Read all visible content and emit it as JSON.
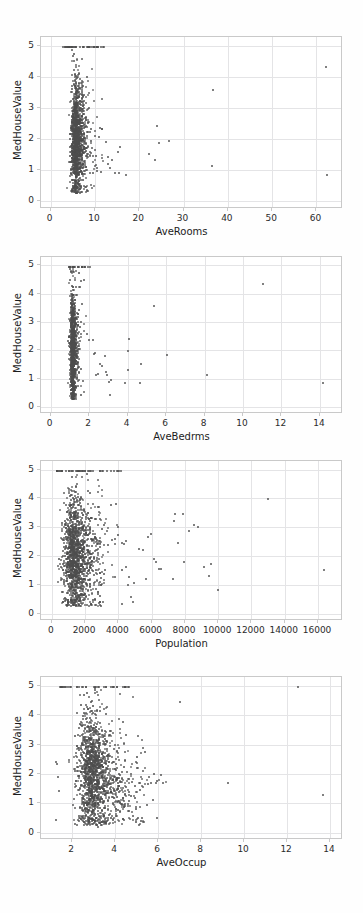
{
  "page": {
    "background_color": "#fefefe",
    "point_color": "#4d4d4d",
    "grid_color": "#e4e4e6",
    "spine_color": "#c9c9c9",
    "axis_text_color": "#2b2b2b"
  },
  "chart_data": [
    {
      "type": "scatter",
      "title": "",
      "xlabel": "AveRooms",
      "ylabel": "MedHouseValue",
      "xlim": [
        -2.2,
        66.0
      ],
      "ylim": [
        -0.25,
        5.3
      ],
      "xticks": [
        0,
        10,
        20,
        30,
        40,
        50,
        60
      ],
      "yticks": [
        0,
        1,
        2,
        3,
        4,
        5
      ],
      "grid": true,
      "legend": "none",
      "cluster": {
        "x_mode": 5.4,
        "x_spread": 1.5,
        "x_min": 1.2,
        "x_max": 12.0,
        "y_mode": 1.9,
        "y_spread": 0.85,
        "y_min": 0.3,
        "y_max": 5.0,
        "n": 1450
      },
      "capped_row": {
        "y": 5.0,
        "x_start": 2.6,
        "x_end": 11.8,
        "n": 46
      },
      "outliers": [
        [
          14.3,
          0.94
        ],
        [
          16.7,
          0.89
        ],
        [
          15.1,
          0.95
        ],
        [
          14.9,
          1.62
        ],
        [
          15.4,
          1.78
        ],
        [
          13.6,
          1.35
        ],
        [
          12.8,
          1.25
        ],
        [
          13.1,
          1.12
        ],
        [
          21.9,
          1.56
        ],
        [
          23.2,
          1.37
        ],
        [
          23.8,
          2.45
        ],
        [
          24.1,
          1.91
        ],
        [
          26.4,
          1.99
        ],
        [
          36.3,
          3.62
        ],
        [
          36.1,
          1.16
        ],
        [
          62.0,
          4.38
        ],
        [
          62.2,
          0.89
        ],
        [
          11.4,
          2.38
        ],
        [
          10.8,
          2.39
        ],
        [
          12.2,
          1.95
        ],
        [
          10.2,
          1.02
        ],
        [
          11.1,
          0.98
        ],
        [
          12.6,
          1.45
        ],
        [
          10.6,
          2.1
        ]
      ]
    },
    {
      "type": "scatter",
      "title": "",
      "xlabel": "AveBedrms",
      "ylabel": "MedHouseValue",
      "xlim": [
        -0.5,
        15.2
      ],
      "ylim": [
        -0.25,
        5.3
      ],
      "xticks": [
        0,
        2,
        4,
        6,
        8,
        10,
        12,
        14
      ],
      "yticks": [
        0,
        1,
        2,
        3,
        4,
        5
      ],
      "grid": true,
      "legend": "none",
      "cluster": {
        "x_mode": 1.08,
        "x_spread": 0.16,
        "x_min": 0.6,
        "x_max": 2.1,
        "y_mode": 1.9,
        "y_spread": 0.9,
        "y_min": 0.3,
        "y_max": 5.0,
        "n": 1100
      },
      "capped_row": {
        "y": 5.0,
        "x_start": 0.9,
        "x_end": 2.0,
        "n": 26
      },
      "outliers": [
        [
          2.2,
          1.9
        ],
        [
          2.25,
          1.96
        ],
        [
          2.3,
          1.18
        ],
        [
          2.4,
          1.2
        ],
        [
          2.5,
          1.55
        ],
        [
          2.6,
          1.5
        ],
        [
          2.75,
          1.82
        ],
        [
          2.85,
          1.28
        ],
        [
          2.9,
          1.18
        ],
        [
          3.0,
          0.93
        ],
        [
          3.05,
          0.45
        ],
        [
          3.1,
          1.0
        ],
        [
          3.8,
          0.89
        ],
        [
          3.95,
          1.36
        ],
        [
          3.98,
          2.0
        ],
        [
          4.0,
          2.45
        ],
        [
          4.6,
          0.9
        ],
        [
          4.65,
          1.55
        ],
        [
          5.3,
          3.62
        ],
        [
          6.0,
          1.88
        ],
        [
          8.05,
          1.16
        ],
        [
          11.0,
          4.38
        ],
        [
          14.1,
          0.89
        ],
        [
          2.15,
          2.4
        ],
        [
          1.95,
          2.4
        ],
        [
          1.85,
          2.6
        ],
        [
          1.6,
          3.68
        ],
        [
          1.55,
          4.5
        ],
        [
          1.7,
          4.52
        ],
        [
          1.45,
          4.28
        ],
        [
          1.3,
          3.15
        ]
      ]
    },
    {
      "type": "scatter",
      "title": "",
      "xlabel": "Population",
      "ylabel": "MedHouseValue",
      "xlim": [
        -650,
        17500
      ],
      "ylim": [
        -0.25,
        5.3
      ],
      "xticks": [
        0,
        2000,
        4000,
        6000,
        8000,
        10000,
        12000,
        14000,
        16000
      ],
      "yticks": [
        0,
        1,
        2,
        3,
        4,
        5
      ],
      "grid": true,
      "legend": "none",
      "cluster": {
        "x_mode": 1200,
        "x_spread": 780,
        "x_min": 80,
        "x_max": 4200,
        "y_mode": 1.85,
        "y_spread": 0.95,
        "y_min": 0.3,
        "y_max": 5.0,
        "n": 1500
      },
      "capped_row": {
        "y": 5.0,
        "x_start": 220,
        "x_end": 4100,
        "n": 48
      },
      "outliers": [
        [
          4600,
          1.33
        ],
        [
          4700,
          0.62
        ],
        [
          4800,
          0.45
        ],
        [
          4900,
          1.1
        ],
        [
          5200,
          2.3
        ],
        [
          5400,
          2.25
        ],
        [
          5600,
          1.25
        ],
        [
          5700,
          2.7
        ],
        [
          5900,
          2.8
        ],
        [
          6050,
          1.95
        ],
        [
          6200,
          1.85
        ],
        [
          6400,
          1.6
        ],
        [
          6500,
          1.58
        ],
        [
          7200,
          1.25
        ],
        [
          7300,
          3.25
        ],
        [
          7350,
          3.5
        ],
        [
          7500,
          2.5
        ],
        [
          7800,
          3.5
        ],
        [
          7900,
          1.85
        ],
        [
          8200,
          2.9
        ],
        [
          8500,
          3.1
        ],
        [
          8700,
          3.05
        ],
        [
          9100,
          1.65
        ],
        [
          9400,
          1.35
        ],
        [
          9500,
          1.78
        ],
        [
          9900,
          0.85
        ],
        [
          12900,
          4.02
        ],
        [
          16300,
          1.55
        ],
        [
          4300,
          2.45
        ],
        [
          4400,
          1.65
        ],
        [
          4500,
          1.05
        ],
        [
          3900,
          3.05
        ]
      ]
    },
    {
      "type": "scatter",
      "title": "",
      "xlabel": "AveOccup",
      "ylabel": "MedHouseValue",
      "xlim": [
        0.55,
        14.6
      ],
      "ylim": [
        -0.25,
        5.3
      ],
      "xticks": [
        2,
        4,
        6,
        8,
        10,
        12,
        14
      ],
      "yticks": [
        0,
        1,
        2,
        3,
        4,
        5
      ],
      "grid": true,
      "legend": "none",
      "cluster": {
        "x_mode": 2.8,
        "x_spread": 0.85,
        "x_min": 1.15,
        "x_max": 5.4,
        "y_mode": 1.85,
        "y_spread": 0.95,
        "y_min": 0.3,
        "y_max": 5.0,
        "n": 1550
      },
      "capped_row": {
        "y": 5.0,
        "x_start": 1.4,
        "x_end": 4.6,
        "n": 42
      },
      "outliers": [
        [
          5.5,
          1.68
        ],
        [
          5.6,
          1.72
        ],
        [
          5.7,
          1.15
        ],
        [
          5.75,
          2.05
        ],
        [
          5.85,
          1.72
        ],
        [
          6.1,
          2.0
        ],
        [
          6.2,
          1.72
        ],
        [
          4.3,
          3.8
        ],
        [
          4.45,
          3.35
        ],
        [
          6.95,
          4.5
        ],
        [
          9.2,
          1.73
        ],
        [
          12.45,
          5.0
        ],
        [
          13.6,
          1.33
        ],
        [
          5.2,
          0.52
        ],
        [
          5.0,
          0.55
        ],
        [
          4.8,
          0.6
        ],
        [
          1.2,
          2.45
        ],
        [
          1.25,
          2.38
        ],
        [
          1.3,
          1.92
        ],
        [
          1.35,
          1.45
        ],
        [
          1.2,
          0.48
        ],
        [
          3.15,
          0.24
        ]
      ]
    }
  ],
  "figures": [
    {
      "index": 1,
      "name": "averooms-vs-medhousevalue"
    },
    {
      "index": 2,
      "name": "avebedrms-vs-medhousevalue"
    },
    {
      "index": 3,
      "name": "population-vs-medhousevalue"
    },
    {
      "index": 4,
      "name": "aveoccup-vs-medhousevalue"
    }
  ]
}
